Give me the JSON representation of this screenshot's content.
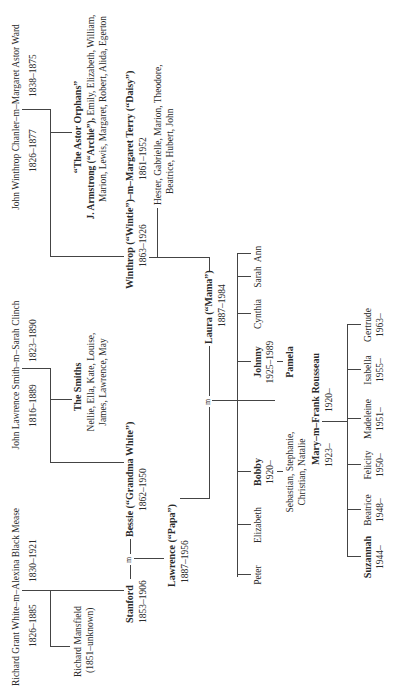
{
  "chandler": {
    "couple": "John Winthrop Chanler–m–Margaret Astor Ward",
    "dates_left": "1826–1877",
    "dates_right": "1838–1875",
    "orphans_title": "“The Astor Orphans”",
    "orphans_line1_bold": "J. Armstrong (“Archie”),",
    "orphans_line1_rest": " Emily, Elizabeth, William,",
    "orphans_line2": "Marion, Lewis, Margaret, Robert, Alida, Egerton",
    "winthrop_couple": "Winthrop (“Wintie”)–m–Margaret Terry (“Daisy”)",
    "winthrop_dates_left": "1863–1926",
    "winthrop_dates_right": "1861–1952",
    "winthrop_children_line1": "Hester, Gabrielle, Marion, Theodore,",
    "winthrop_children_line2": "Beatrice, Hubert, John"
  },
  "smith": {
    "couple": "John Lawrence Smith–m–Sarah Clinch",
    "dates_left": "1816–1889",
    "dates_right": "1823–1890",
    "smiths_title": "The Smiths",
    "smiths_line1": "Nellie, Ella, Kate, Louise,",
    "smiths_line2": "James, Lawrence, May"
  },
  "white": {
    "couple": "Richard Grant White–m–Alexina Black Mease",
    "dates_left": "1826–1885",
    "dates_right": "1830–1921",
    "mansfield_name": "Richard Mansfield",
    "mansfield_dates": "(1851–unknown)",
    "stanford": "Stanford",
    "stanford_dates": "1853–1906",
    "marriage_m": "m",
    "bessie": "Bessie (“Grandma White”)",
    "bessie_dates": "1862–1950"
  },
  "parents": {
    "lawrence": "Lawrence (“Papa”)",
    "lawrence_dates": "1887–1956",
    "marriage_m": "m",
    "laura": "Laura (“Mama”)",
    "laura_dates": "1887–1984"
  },
  "children": [
    {
      "name": "Peter",
      "bold": false,
      "dates": ""
    },
    {
      "name": "Elizabeth",
      "bold": false,
      "dates": ""
    },
    {
      "name": "Bobby",
      "bold": true,
      "dates": "1920–"
    },
    {
      "name": "Johnny",
      "bold": true,
      "dates": "1925–1989"
    },
    {
      "name": "Cynthia",
      "bold": false,
      "dates": ""
    },
    {
      "name": "Sarah",
      "bold": false,
      "dates": ""
    },
    {
      "name": "Ann",
      "bold": false,
      "dates": ""
    }
  ],
  "bobby_children_line1": "Sebastian, Stephanie,",
  "bobby_children_line2": "Christian, Natalie",
  "johnny_spouse": "Pamela",
  "mary_couple": "Mary–m–Frank Rousseau",
  "mary_dates": "1923–",
  "frank_dates": "1920–",
  "grandchildren": [
    {
      "name": "Suzannah",
      "bold": true,
      "dates": "1944–"
    },
    {
      "name": "Beatrice",
      "bold": false,
      "dates": "1948–"
    },
    {
      "name": "Felicity",
      "bold": false,
      "dates": "1950–"
    },
    {
      "name": "Madeleine",
      "bold": false,
      "dates": "1951–"
    },
    {
      "name": "Isabella",
      "bold": false,
      "dates": "1955–"
    },
    {
      "name": "Gertrude",
      "bold": false,
      "dates": "1963–"
    }
  ]
}
